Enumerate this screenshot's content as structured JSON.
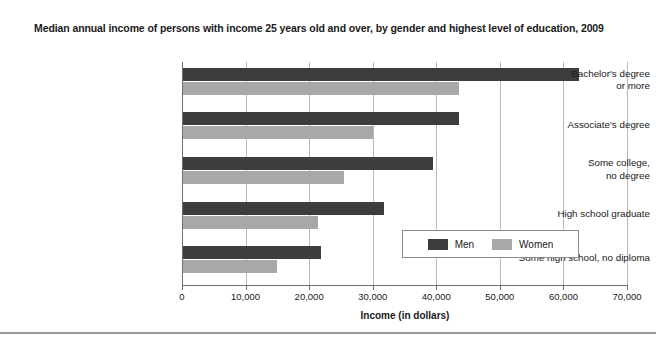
{
  "chart_data": {
    "type": "bar",
    "orientation": "horizontal",
    "title": "Median annual income of persons with income 25 years old and over, by gender and highest level of education, 2009",
    "xlabel": "Income (in dollars)",
    "ylabel": "",
    "xlim": [
      0,
      70000
    ],
    "grid": true,
    "legend_position": "inside-lower-right",
    "categories": [
      "Bachelor's degree\nor more",
      "Associate's degree",
      "Some college,\nno degree",
      "High school graduate",
      "Some high school, no diploma"
    ],
    "xticks": [
      0,
      10000,
      20000,
      30000,
      40000,
      50000,
      60000,
      70000
    ],
    "xticklabels": [
      "0",
      "10,000",
      "20,000",
      "30,000",
      "40,000",
      "50,000",
      "60,000",
      "70,000"
    ],
    "series": [
      {
        "name": "Men",
        "color": "#3d3d3d",
        "values": [
          62500,
          43500,
          39500,
          31800,
          21900
        ]
      },
      {
        "name": "Women",
        "color": "#a8a8a8",
        "values": [
          43500,
          30000,
          25500,
          21400,
          14900
        ]
      }
    ]
  },
  "legend": {
    "entries": [
      {
        "label": "Men"
      },
      {
        "label": "Women"
      }
    ]
  }
}
